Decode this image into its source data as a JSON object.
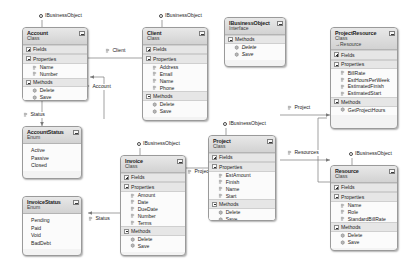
{
  "diagram": {
    "colors": {
      "header_start": "#e8e8e8",
      "header_end": "#d2d2d2",
      "compartment": "#e6e6e6",
      "body": "#fbfbfb",
      "border": "#9a9a9a",
      "connector": "#7a7a7a",
      "text": "#1b1b1b"
    },
    "labels": {
      "fields": "Fields",
      "properties": "Properties",
      "methods": "Methods",
      "kind_class": "Class",
      "kind_enum": "Enum",
      "kind_interface": "Interface"
    }
  },
  "shapes": {
    "account": {
      "name": "Account",
      "kind": "Class",
      "interface_label": "IBusinessObject",
      "fields": "Fields",
      "properties": "Properties",
      "property_items": [
        "Name",
        "Number"
      ],
      "methods": "Methods",
      "method_items": [
        "Delete",
        "Save"
      ]
    },
    "client": {
      "name": "Client",
      "kind": "Class",
      "interface_label": "IBusinessObject",
      "fields": "Fields",
      "properties": "Properties",
      "property_items": [
        "Address",
        "Email",
        "Name",
        "Phone"
      ],
      "methods": "Methods",
      "method_items": [
        "Delete",
        "Save"
      ]
    },
    "ibusinessobject": {
      "name": "IBusinessObject",
      "kind": "Interface",
      "methods": "Methods",
      "method_items": [
        "Delete",
        "Save"
      ]
    },
    "project_resource": {
      "name": "ProjectResource",
      "kind": "Class",
      "base": "Resource",
      "fields": "Fields",
      "properties": "Properties",
      "property_items": [
        "BillRate",
        "EstHoursPerWeek",
        "EstimatedFinish",
        "EstimatedStart"
      ],
      "methods": "Methods",
      "method_items": [
        "GetProjectHours"
      ]
    },
    "account_status": {
      "name": "AccountStatus",
      "kind": "Enum",
      "values": [
        "Active",
        "Passive",
        "Closed"
      ]
    },
    "invoice_status": {
      "name": "InvoiceStatus",
      "kind": "Enum",
      "values": [
        "Pending",
        "Paid",
        "Void",
        "BadDebt"
      ]
    },
    "invoice": {
      "name": "Invoice",
      "kind": "Class",
      "interface_label": "IBusinessObject",
      "fields": "Fields",
      "properties": "Properties",
      "property_items": [
        "Amount",
        "Date",
        "DueDate",
        "Number",
        "Terms"
      ],
      "methods": "Methods",
      "method_items": [
        "Delete",
        "Save"
      ]
    },
    "project": {
      "name": "Project",
      "kind": "Class",
      "interface_label": "IBusinessObject",
      "fields": "Fields",
      "properties": "Properties",
      "property_items": [
        "EstAmount",
        "Finish",
        "Name",
        "Start"
      ],
      "methods": "Methods",
      "method_items": [
        "Delete",
        "Save"
      ]
    },
    "resource": {
      "name": "Resource",
      "kind": "Class",
      "interface_label": "IBusinessObject",
      "fields": "Fields",
      "properties": "Properties",
      "property_items": [
        "Name",
        "Role",
        "StandardBillRate"
      ],
      "methods": "Methods",
      "method_items": [
        "Delete",
        "Save"
      ]
    }
  },
  "associations": {
    "client": "Client",
    "account": "Account",
    "status_account": "Status",
    "status_invoice": "Status",
    "project_invoice": "Project",
    "project_right": "Project",
    "resources": "Resources"
  }
}
